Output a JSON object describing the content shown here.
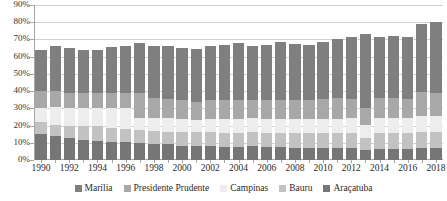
{
  "chart_data": {
    "type": "bar",
    "subtype": "stacked-bar",
    "title": "",
    "xlabel": "",
    "ylabel": "",
    "ylim": [
      0,
      90
    ],
    "y_tick_step": 10,
    "y_tick_labels": [
      "0%",
      "10%",
      "20%",
      "30%",
      "40%",
      "50%",
      "60%",
      "70%",
      "80%",
      "90%"
    ],
    "y_unit": "percent",
    "grid": true,
    "legend_position": "bottom",
    "x_label_interval": 2,
    "categories": [
      "1990",
      "1991",
      "1992",
      "1993",
      "1994",
      "1995",
      "1996",
      "1997",
      "1998",
      "1999",
      "2000",
      "2001",
      "2002",
      "2003",
      "2004",
      "2005",
      "2006",
      "2007",
      "2008",
      "2009",
      "2010",
      "2011",
      "2012",
      "2013",
      "2014",
      "2015",
      "2016",
      "2017",
      "2018"
    ],
    "x_tick_labels": [
      "1990",
      "1992",
      "1994",
      "1996",
      "1998",
      "2000",
      "2002",
      "2004",
      "2006",
      "2008",
      "2010",
      "2012",
      "2014",
      "2016",
      "2018"
    ],
    "series": [
      {
        "name": "Araçatuba",
        "color": "#767676",
        "values": [
          15.0,
          14.0,
          12.5,
          11.5,
          11.2,
          10.5,
          10.3,
          10.0,
          9.5,
          9.3,
          8.3,
          8.0,
          8.2,
          7.8,
          7.7,
          8.3,
          7.5,
          7.3,
          7.0,
          7.0,
          7.2,
          7.0,
          6.8,
          6.0,
          6.5,
          6.5,
          6.5,
          7.0,
          7.0
        ]
      },
      {
        "name": "Bauru",
        "color": "#c2c2c2",
        "values": [
          7.0,
          6.3,
          7.5,
          8.5,
          8.3,
          8.0,
          7.7,
          7.5,
          7.5,
          7.2,
          8.0,
          8.0,
          8.0,
          8.0,
          8.2,
          8.0,
          8.3,
          8.5,
          8.5,
          8.5,
          8.3,
          8.5,
          8.8,
          7.0,
          9.0,
          9.0,
          9.0,
          9.3,
          9.5
        ]
      },
      {
        "name": "Campinas",
        "color": "#ededed",
        "values": [
          8.5,
          10.2,
          10.0,
          10.0,
          10.5,
          11.5,
          12.0,
          7.0,
          7.5,
          8.0,
          7.5,
          7.5,
          7.8,
          8.0,
          8.2,
          8.0,
          8.2,
          8.2,
          8.3,
          8.2,
          8.5,
          8.5,
          8.8,
          7.5,
          9.0,
          9.0,
          8.8,
          9.0,
          9.0
        ]
      },
      {
        "name": "Presidente Prudente",
        "color": "#a8a8a8",
        "values": [
          9.5,
          9.5,
          9.0,
          9.0,
          9.0,
          9.0,
          9.0,
          14.5,
          11.5,
          11.0,
          11.2,
          10.0,
          10.7,
          11.0,
          11.0,
          10.5,
          11.0,
          11.0,
          11.2,
          11.3,
          11.5,
          12.0,
          11.0,
          9.5,
          11.5,
          11.5,
          11.2,
          14.0,
          13.5
        ]
      },
      {
        "name": "Marília",
        "color": "#7f7f7f",
        "values": [
          24.0,
          26.0,
          26.0,
          25.0,
          25.0,
          26.5,
          27.0,
          29.0,
          30.0,
          30.5,
          30.0,
          31.0,
          31.3,
          32.2,
          33.0,
          31.2,
          31.8,
          33.5,
          32.5,
          32.0,
          33.0,
          34.5,
          36.2,
          43.0,
          35.5,
          36.0,
          35.8,
          39.7,
          41.0
        ]
      }
    ],
    "totals": [
      64.0,
      66.0,
      65.0,
      64.0,
      64.0,
      65.5,
      66.0,
      68.0,
      66.0,
      66.0,
      65.0,
      64.5,
      66.0,
      67.0,
      68.1,
      66.0,
      66.8,
      68.5,
      67.5,
      67.0,
      68.5,
      70.5,
      71.6,
      73.0,
      71.5,
      72.0,
      71.3,
      79.0,
      80.0
    ]
  },
  "legend": {
    "items": [
      {
        "label": "Marília"
      },
      {
        "label": "Presidente Prudente"
      },
      {
        "label": "Campinas"
      },
      {
        "label": "Bauru"
      },
      {
        "label": "Araçatuba"
      }
    ]
  }
}
